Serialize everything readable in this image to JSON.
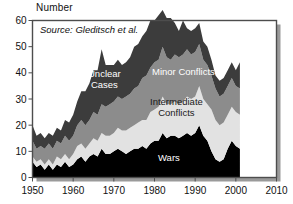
{
  "figure": {
    "axis_title_y": "Number",
    "source_note": "Source: Gleditsch et al.",
    "frame_color": "#4d4d4d",
    "shadow_color": "#9a9a9a",
    "background": "#ffffff"
  },
  "labels": {
    "unclear_line1": "Unclear",
    "unclear_line2": "Cases",
    "minor": "Minor Conflicts",
    "intermediate_line1": "Intermediate",
    "intermediate_line2": "Conflicts",
    "wars": "Wars"
  },
  "chart_data": {
    "type": "area",
    "title": "",
    "subtitle": "",
    "annotations": [
      "Source: Gleditsch et al."
    ],
    "xlabel": "",
    "ylabel": "Number",
    "xlim": [
      1950,
      2010
    ],
    "ylim": [
      0,
      60
    ],
    "xticks": [
      1950,
      1960,
      1970,
      1980,
      1990,
      2000,
      2010
    ],
    "yticks": [
      0,
      10,
      20,
      30,
      40,
      50,
      60
    ],
    "grid": false,
    "legend": "in-plot band labels",
    "stacked": true,
    "stack_order_bottom_to_top": [
      "Wars",
      "Intermediate Conflicts",
      "Minor Conflicts",
      "Unclear Cases"
    ],
    "colors": {
      "Wars": "#000000",
      "Intermediate Conflicts": "#e2e2e2",
      "Minor Conflicts": "#8c8c8c",
      "Unclear Cases": "#3c3c3c"
    },
    "x": [
      1950,
      1951,
      1952,
      1953,
      1954,
      1955,
      1956,
      1957,
      1958,
      1959,
      1960,
      1961,
      1962,
      1963,
      1964,
      1965,
      1966,
      1967,
      1968,
      1969,
      1970,
      1971,
      1972,
      1973,
      1974,
      1975,
      1976,
      1977,
      1978,
      1979,
      1980,
      1981,
      1982,
      1983,
      1984,
      1985,
      1986,
      1987,
      1988,
      1989,
      1990,
      1991,
      1992,
      1993,
      1994,
      1995,
      1996,
      1997,
      1998,
      1999,
      2000,
      2001
    ],
    "series": [
      {
        "name": "Wars",
        "values": [
          6,
          4,
          5,
          3,
          5,
          3,
          5,
          4,
          6,
          4,
          5,
          7,
          8,
          6,
          8,
          9,
          8,
          11,
          9,
          9,
          10,
          11,
          10,
          9,
          10,
          11,
          11,
          12,
          11,
          13,
          14,
          14,
          17,
          15,
          16,
          16,
          15,
          16,
          17,
          16,
          17,
          20,
          16,
          14,
          10,
          7,
          6,
          7,
          11,
          14,
          12,
          11
        ]
      },
      {
        "name": "Intermediate Conflicts",
        "values": [
          2,
          2,
          2,
          2,
          2,
          2,
          3,
          3,
          3,
          3,
          4,
          5,
          5,
          5,
          5,
          6,
          6,
          6,
          7,
          7,
          7,
          8,
          8,
          9,
          9,
          9,
          10,
          10,
          11,
          12,
          12,
          13,
          14,
          13,
          12,
          13,
          13,
          13,
          14,
          14,
          14,
          15,
          14,
          14,
          16,
          15,
          14,
          14,
          13,
          13,
          13,
          13
        ]
      },
      {
        "name": "Minor Conflicts",
        "values": [
          6,
          5,
          5,
          6,
          6,
          6,
          6,
          6,
          7,
          7,
          7,
          8,
          9,
          9,
          9,
          10,
          10,
          11,
          11,
          12,
          12,
          12,
          12,
          13,
          13,
          14,
          14,
          16,
          17,
          17,
          18,
          18,
          19,
          18,
          17,
          18,
          18,
          18,
          18,
          17,
          17,
          16,
          15,
          15,
          13,
          12,
          11,
          11,
          11,
          11,
          10,
          10
        ]
      },
      {
        "name": "Unclear Cases",
        "values": [
          6,
          5,
          5,
          4,
          4,
          5,
          5,
          5,
          6,
          7,
          8,
          9,
          11,
          13,
          14,
          16,
          17,
          21,
          16,
          15,
          14,
          14,
          13,
          13,
          14,
          16,
          16,
          16,
          17,
          18,
          16,
          17,
          14,
          15,
          16,
          12,
          10,
          13,
          8,
          9,
          9,
          8,
          7,
          7,
          6,
          5,
          6,
          6,
          6,
          6,
          6,
          10
        ]
      }
    ]
  }
}
